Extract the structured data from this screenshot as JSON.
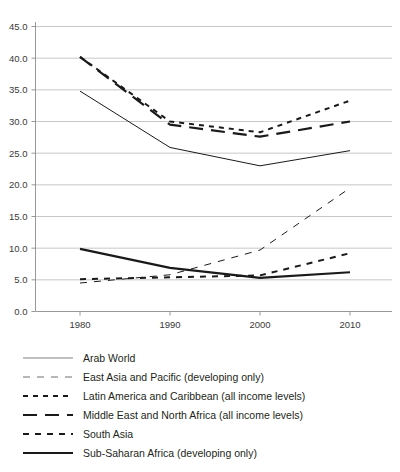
{
  "chart_data": {
    "type": "line",
    "title": "",
    "subtitle": "",
    "xlabel": "",
    "ylabel": "",
    "x": [
      "1980",
      "1990",
      "2000",
      "2010"
    ],
    "categories": [
      "1980",
      "1990",
      "2000",
      "2010"
    ],
    "xlim": [
      1980,
      2010
    ],
    "ylim": [
      0.0,
      45.0
    ],
    "y_ticks": [
      "0.0",
      "5.0",
      "10.0",
      "15.0",
      "20.0",
      "25.0",
      "30.0",
      "35.0",
      "40.0",
      "45.0"
    ],
    "x_ticks": [
      "1980",
      "1990",
      "2000",
      "2010"
    ],
    "grid": "horizontal",
    "legend_position": "bottom-left",
    "series": [
      {
        "name": "Arab World",
        "line_style": "solid-thin",
        "color": "#808080",
        "values": [
          34.8,
          25.9,
          23.0,
          25.4
        ]
      },
      {
        "name": "East Asia and Pacific (developing only)",
        "line_style": "long-dash-thin",
        "color": "#6e6e6e",
        "values": [
          4.5,
          5.8,
          9.7,
          19.5
        ]
      },
      {
        "name": "Latin America and Caribbean (all income levels)",
        "line_style": "short-dash-bold",
        "color": "#1a1a1a",
        "values": [
          40.2,
          30.0,
          28.3,
          33.3
        ]
      },
      {
        "name": "Middle East and North Africa (all income levels)",
        "line_style": "long-dash-bold",
        "color": "#1a1a1a",
        "values": [
          40.2,
          29.5,
          27.6,
          30.0
        ]
      },
      {
        "name": "South Asia",
        "line_style": "medium-dash-bold",
        "color": "#1a1a1a",
        "values": [
          5.1,
          5.4,
          5.7,
          9.2
        ]
      },
      {
        "name": "Sub-Saharan Africa (developing only)",
        "line_style": "solid-bold",
        "color": "#1a1a1a",
        "values": [
          9.9,
          6.9,
          5.3,
          6.2
        ]
      }
    ]
  },
  "legend": {
    "items": [
      {
        "label": "Arab World",
        "swatch": "line-solid-thin-icon"
      },
      {
        "label": "East Asia and Pacific (developing only)",
        "swatch": "line-long-dash-thin-icon"
      },
      {
        "label": "Latin America and Caribbean (all income levels)",
        "swatch": "line-short-dash-bold-icon"
      },
      {
        "label": "Middle East and North Africa (all income levels)",
        "swatch": "line-long-dash-bold-icon"
      },
      {
        "label": "South Asia",
        "swatch": "line-medium-dash-bold-icon"
      },
      {
        "label": "Sub-Saharan Africa (developing only)",
        "swatch": "line-solid-bold-icon"
      }
    ]
  }
}
